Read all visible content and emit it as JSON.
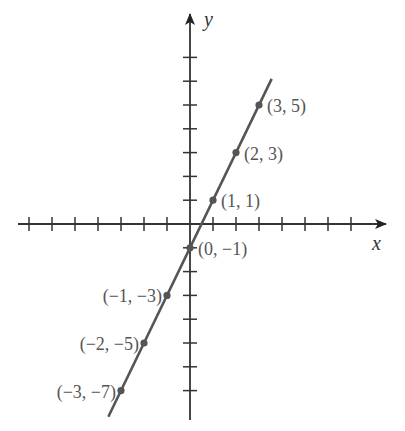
{
  "chart_data": {
    "type": "line",
    "title": "",
    "xlabel": "x",
    "ylabel": "y",
    "xlim": [
      -7,
      8
    ],
    "ylim": [
      -8,
      8
    ],
    "grid": false,
    "legend": null,
    "x_ticks": [
      -7,
      -6,
      -5,
      -4,
      -3,
      -2,
      -1,
      1,
      2,
      3,
      4,
      5,
      6,
      7
    ],
    "y_ticks": [
      -7,
      -6,
      -5,
      -4,
      -3,
      -2,
      -1,
      1,
      2,
      3,
      4,
      5,
      6,
      7
    ],
    "tick_labels_shown": false,
    "series": [
      {
        "name": "y = 2x - 1",
        "x": [
          -3,
          -2,
          -1,
          0,
          1,
          2,
          3
        ],
        "values": [
          -7,
          -5,
          -3,
          -1,
          1,
          3,
          5
        ],
        "line_extent_x": [
          -3.55,
          3.55
        ],
        "color": "#555555"
      }
    ],
    "annotations": [
      {
        "text": "(3, 5)",
        "x": 3,
        "y": 5,
        "side": "right"
      },
      {
        "text": "(2, 3)",
        "x": 2,
        "y": 3,
        "side": "right"
      },
      {
        "text": "(1, 1)",
        "x": 1,
        "y": 1,
        "side": "right"
      },
      {
        "text": "(0, −1)",
        "x": 0,
        "y": -1,
        "side": "right"
      },
      {
        "text": "(−1, −3)",
        "x": -1,
        "y": -3,
        "side": "left"
      },
      {
        "text": "(−2, −5)",
        "x": -2,
        "y": -5,
        "side": "left"
      },
      {
        "text": "(−3, −7)",
        "x": -3,
        "y": -7,
        "side": "left"
      }
    ]
  },
  "labels": {
    "x_axis": "x",
    "y_axis": "y"
  },
  "colors": {
    "axis": "#333333",
    "line": "#555555",
    "point": "#555555",
    "text": "#555555"
  }
}
